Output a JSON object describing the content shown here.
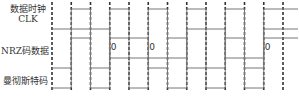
{
  "labels": {
    "clk_cn": "数据时钟",
    "clk": "CLK",
    "nrz": "NRZ码数据",
    "manchester": "曼彻斯特码"
  },
  "colors": {
    "trace": "#777777",
    "grid": "#333333"
  },
  "segments": 12,
  "signals": {
    "clk": [
      0,
      1,
      0,
      1,
      0,
      1,
      0,
      1,
      0,
      1,
      0,
      1
    ],
    "nrz": [
      1,
      1,
      1,
      0,
      0,
      0,
      0,
      1,
      1,
      0,
      0,
      1
    ],
    "manchester": [
      0,
      1,
      0,
      1,
      1,
      0,
      1,
      0,
      0,
      1,
      0,
      1
    ]
  },
  "bit_labels": [
    {
      "text": "0",
      "segment": 3
    },
    {
      "text": "0",
      "segment": 5
    },
    {
      "text": "0",
      "segment": 11
    }
  ]
}
